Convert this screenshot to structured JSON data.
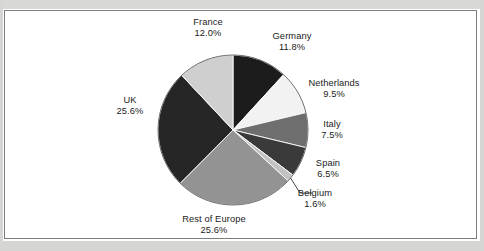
{
  "figure": {
    "frame_border_color": "#7d7d7d",
    "background_color": "#ffffff",
    "text_color": "#1b1b1b"
  },
  "chart_data": {
    "type": "pie",
    "title": "",
    "subtitle": "",
    "xlabel": "",
    "ylabel": "",
    "legend_position": "none",
    "labels_position": "outside",
    "units": "percent",
    "total": "100.1%",
    "start_angle_deg": 0,
    "direction": "clockwise",
    "center": {
      "x": 233,
      "y": 130
    },
    "radius": 75,
    "categories": [
      "Germany",
      "Netherlands",
      "Italy",
      "Spain",
      "Belgium",
      "Rest of Europe",
      "UK",
      "France"
    ],
    "values": [
      11.8,
      9.5,
      7.5,
      6.5,
      1.6,
      25.6,
      25.6,
      12.0
    ],
    "slices": [
      {
        "name": "Germany",
        "value": 11.8,
        "label": "Germany",
        "percent_label": "11.8%",
        "color": "#1c1c1c",
        "leader_line": false
      },
      {
        "name": "Netherlands",
        "value": 9.5,
        "label": "Netherlands",
        "percent_label": "9.5%",
        "color": "#f2f2f2",
        "leader_line": false
      },
      {
        "name": "Italy",
        "value": 7.5,
        "label": "Italy",
        "percent_label": "7.5%",
        "color": "#6e6e6e",
        "leader_line": false
      },
      {
        "name": "Spain",
        "value": 6.5,
        "label": "Spain",
        "percent_label": "6.5%",
        "color": "#3a3a3a",
        "leader_line": false
      },
      {
        "name": "Belgium",
        "value": 1.6,
        "label": "Belgium",
        "percent_label": "1.6%",
        "color": "#c2c2c2",
        "leader_line": true
      },
      {
        "name": "Rest of Europe",
        "value": 25.6,
        "label": "Rest of Europe",
        "percent_label": "25.6%",
        "color": "#939393",
        "leader_line": false
      },
      {
        "name": "UK",
        "value": 25.6,
        "label": "UK",
        "percent_label": "25.6%",
        "color": "#262626",
        "leader_line": false
      },
      {
        "name": "France",
        "value": 12.0,
        "label": "France",
        "percent_label": "12.0%",
        "color": "#cfcfcf",
        "leader_line": false
      }
    ]
  }
}
